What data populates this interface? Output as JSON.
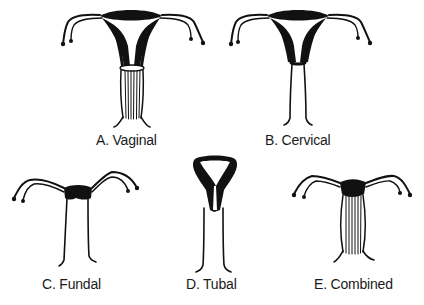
{
  "figure": {
    "ink_color": "#111111",
    "background": "#ffffff",
    "panels": [
      {
        "id": "A",
        "label": "A. Vaginal"
      },
      {
        "id": "B",
        "label": "B. Cervical"
      },
      {
        "id": "C",
        "label": "C. Fundal"
      },
      {
        "id": "D",
        "label": "D. Tubal"
      },
      {
        "id": "E",
        "label": "E. Combined"
      }
    ]
  }
}
